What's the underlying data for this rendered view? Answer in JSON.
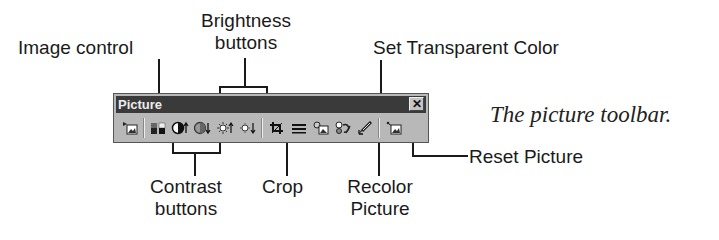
{
  "toolbar": {
    "title": "Picture",
    "close_label": "✕",
    "buttons": [
      {
        "id": "insert-picture",
        "icon": "insert-picture-icon"
      },
      {
        "id": "image-control",
        "icon": "image-control-icon"
      },
      {
        "id": "more-contrast",
        "icon": "contrast-up-icon"
      },
      {
        "id": "less-contrast",
        "icon": "contrast-down-icon"
      },
      {
        "id": "more-brightness",
        "icon": "brightness-up-icon"
      },
      {
        "id": "less-brightness",
        "icon": "brightness-down-icon"
      },
      {
        "id": "crop",
        "icon": "crop-icon"
      },
      {
        "id": "line-style",
        "icon": "line-style-icon"
      },
      {
        "id": "format-picture",
        "icon": "format-picture-icon"
      },
      {
        "id": "recolor-picture",
        "icon": "recolor-icon"
      },
      {
        "id": "set-transparent-color",
        "icon": "pen-icon"
      },
      {
        "id": "reset-picture",
        "icon": "reset-picture-icon"
      }
    ]
  },
  "callouts": {
    "image_control": "Image control",
    "brightness_line1": "Brightness",
    "brightness_line2": "buttons",
    "set_transparent_color": "Set Transparent Color",
    "contrast_line1": "Contrast",
    "contrast_line2": "buttons",
    "crop": "Crop",
    "recolor_line1": "Recolor",
    "recolor_line2": "Picture",
    "reset_picture": "Reset Picture"
  },
  "caption": "The picture toolbar."
}
